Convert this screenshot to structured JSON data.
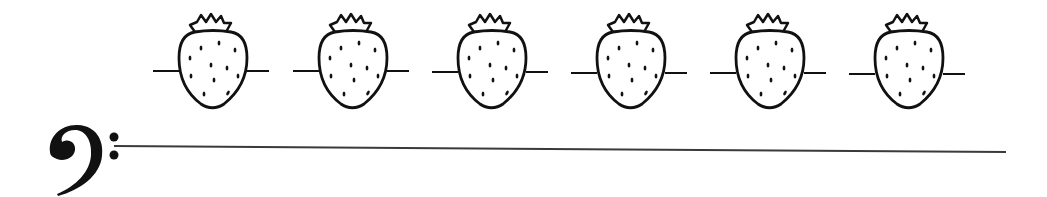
{
  "worksheet": {
    "clef": {
      "name": "bass-clef",
      "symbol": "𝄢"
    },
    "staff": {
      "line_count": 1,
      "color": "#3a3a3a"
    },
    "notes": [
      {
        "index": 1,
        "shape": "strawberry",
        "center_x": 213,
        "has_ledger_line": true
      },
      {
        "index": 2,
        "shape": "strawberry",
        "center_x": 353,
        "has_ledger_line": true
      },
      {
        "index": 3,
        "shape": "strawberry",
        "center_x": 492,
        "has_ledger_line": true
      },
      {
        "index": 4,
        "shape": "strawberry",
        "center_x": 631,
        "has_ledger_line": true
      },
      {
        "index": 5,
        "shape": "strawberry",
        "center_x": 770,
        "has_ledger_line": true
      },
      {
        "index": 6,
        "shape": "strawberry",
        "center_x": 909,
        "has_ledger_line": true
      }
    ],
    "colors": {
      "ink": "#111111",
      "background": "#ffffff"
    }
  }
}
